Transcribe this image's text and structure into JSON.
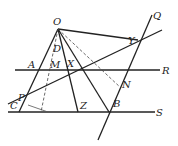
{
  "diagram": {
    "type": "geometry-figure",
    "labels": {
      "O": "O",
      "Q": "Q",
      "Y": "Y",
      "D": "D",
      "A": "A",
      "M": "M",
      "X": "X",
      "R": "R",
      "N": "N",
      "P": "P",
      "C": "C",
      "Z": "Z",
      "B": "B",
      "S": "S"
    },
    "points": {
      "O": [
        58,
        29
      ],
      "Y": [
        138,
        40
      ],
      "A": [
        36,
        70
      ],
      "M": [
        50,
        70
      ],
      "X": [
        68,
        70
      ],
      "P": [
        25,
        96
      ],
      "C": [
        19,
        112
      ],
      "Z": [
        78,
        112
      ],
      "B": [
        109,
        112
      ],
      "N": [
        121,
        88
      ]
    },
    "parallel_lines": [
      "R",
      "S"
    ],
    "stroke_color": "#222222"
  }
}
